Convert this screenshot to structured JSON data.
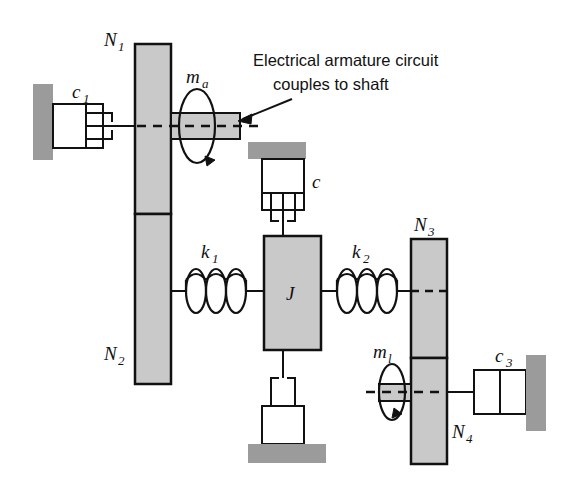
{
  "figure": {
    "background_color": "#ffffff",
    "line_color": "#111111",
    "fill_gray": "#c9c9c9",
    "wall_gray": "#9b9b9b"
  },
  "annotation": {
    "line1": "Electrical armature circuit",
    "line2": "couples to shaft",
    "arrow": "arrow pointing to armature block"
  },
  "labels": {
    "n1": "N",
    "n1_sub": "1",
    "n2": "N",
    "n2_sub": "2",
    "n3": "N",
    "n3_sub": "3",
    "n4": "N",
    "n4_sub": "4",
    "ma": "m",
    "ma_sub": "a",
    "ml": "m",
    "ml_sub": "l",
    "c1": "c",
    "c1_sub": "1",
    "c": "c",
    "c3": "c",
    "c3_sub": "3",
    "k1": "k",
    "k1_sub": "1",
    "k2": "k",
    "k2_sub": "2",
    "j": "J"
  },
  "components": [
    {
      "id": "wall-left",
      "kind": "fixed-wall",
      "label": null
    },
    {
      "id": "damper-c1",
      "kind": "damper",
      "label": "c1"
    },
    {
      "id": "gear-column-n1n2",
      "kind": "gear-pair",
      "label": "N1 / N2"
    },
    {
      "id": "armature-ma",
      "kind": "rotating-inertia",
      "label": "ma"
    },
    {
      "id": "ceiling-support",
      "kind": "fixed-ceiling",
      "label": null
    },
    {
      "id": "damper-c",
      "kind": "damper",
      "label": "c"
    },
    {
      "id": "spring-k1",
      "kind": "spring",
      "label": "k1"
    },
    {
      "id": "inertia-j",
      "kind": "inertia-block",
      "label": "J"
    },
    {
      "id": "spring-k2",
      "kind": "spring",
      "label": "k2"
    },
    {
      "id": "floor-support",
      "kind": "fixed-floor",
      "label": null
    },
    {
      "id": "damper-bottom",
      "kind": "damper",
      "label": null
    },
    {
      "id": "gear-column-n3n4",
      "kind": "gear-pair",
      "label": "N3 / N4"
    },
    {
      "id": "load-ml",
      "kind": "rotating-inertia",
      "label": "ml"
    },
    {
      "id": "damper-c3",
      "kind": "damper",
      "label": "c3"
    },
    {
      "id": "wall-right",
      "kind": "fixed-wall",
      "label": null
    }
  ]
}
